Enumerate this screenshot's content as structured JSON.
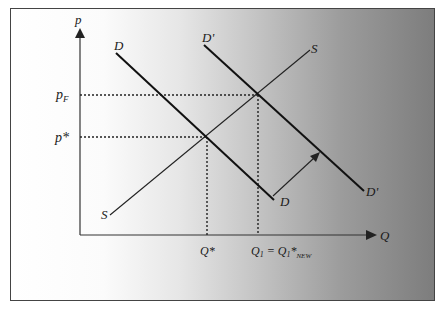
{
  "diagram": {
    "type": "supply-demand",
    "axes": {
      "y_label": "p",
      "x_label": "Q"
    },
    "curves": {
      "demand_original": {
        "label_top": "D",
        "label_bottom": "D"
      },
      "demand_shifted": {
        "label_top": "D'",
        "label_bottom": "D'"
      },
      "supply": {
        "label_top": "S",
        "label_bottom": "S"
      }
    },
    "price_levels": {
      "pF": {
        "base": "p",
        "subscript": "F"
      },
      "p_star": {
        "text": "p*"
      }
    },
    "quantity_levels": {
      "q_star": {
        "text": "Q*"
      },
      "q1": {
        "base": "Q",
        "sub1": "1",
        "eq": " = ",
        "base2": "Q",
        "sub2": "1",
        "star": "*",
        "sub3": "NEW"
      }
    },
    "shift_arrow": "demand shift D to D'",
    "colors": {
      "curve": "#111111",
      "supply": "#222222",
      "axis": "#333333",
      "guide": "#222222",
      "frame_border": "#444444"
    }
  }
}
